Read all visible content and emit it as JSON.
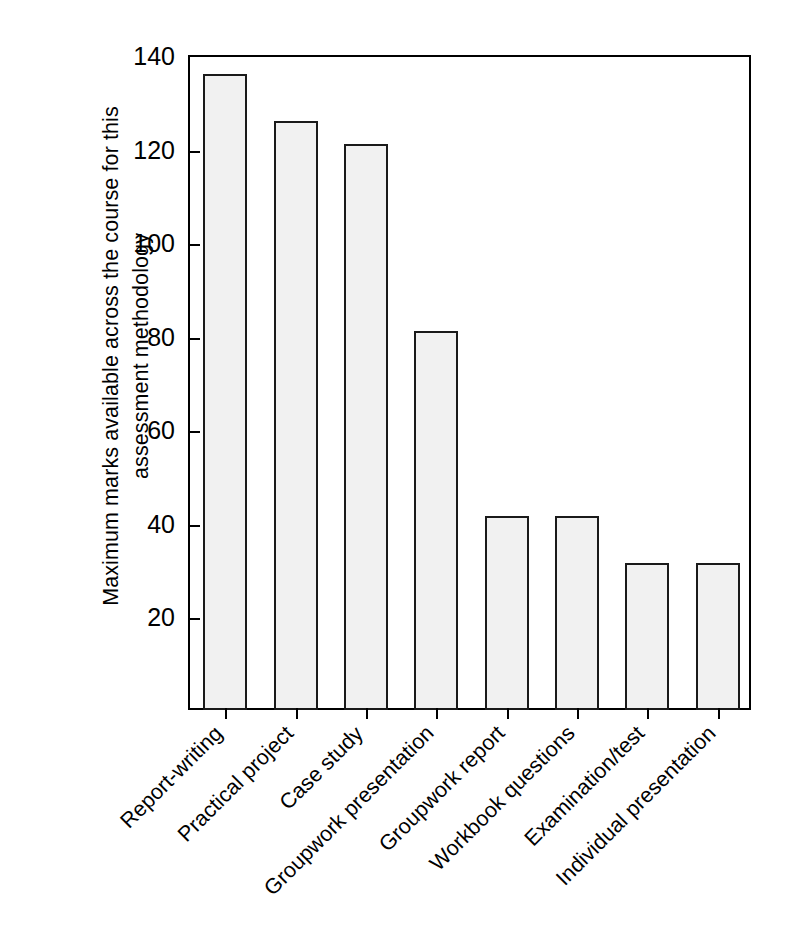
{
  "chart_data": {
    "type": "bar",
    "title": "",
    "subtitle": "",
    "xlabel": "",
    "ylabel": "Maximum marks available across the course for this assessment methodology",
    "ylabel_lines": [
      "Maximum marks available across the course for this",
      "assessment methodology"
    ],
    "categories": [
      "Report-writing",
      "Practical project",
      "Case study",
      "Groupwork presentation",
      "Groupwork report",
      "Workbook questions",
      "Examination/test",
      "Individual presentation"
    ],
    "values": [
      135.5,
      125.5,
      120.5,
      80.5,
      41,
      41,
      31,
      31
    ],
    "ylim": [
      0,
      140
    ],
    "yticks": [
      20,
      40,
      60,
      80,
      100,
      120,
      140
    ],
    "ytick_labels": [
      "20",
      "40",
      "60",
      "80",
      "100",
      "120",
      "140"
    ],
    "grid": false,
    "legend": null,
    "bar_fill": "#f1f1f1",
    "bar_edge": "#1a1a1a",
    "axis_color": "#000000",
    "background": "#ffffff",
    "xtick_label_rotation": -45
  }
}
